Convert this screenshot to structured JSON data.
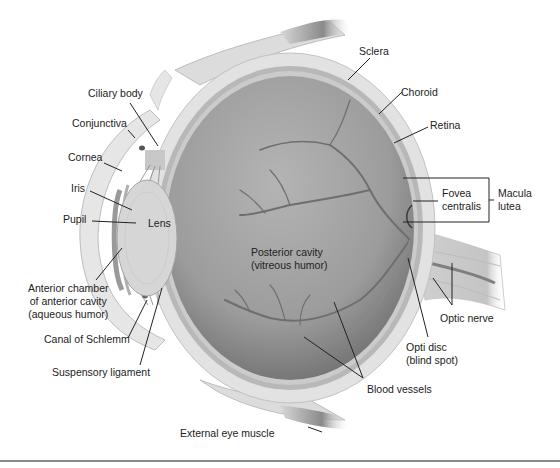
{
  "diagram": {
    "colors": {
      "background": "#ffffff",
      "sclera": "#dcdcdc",
      "choroid": "#b5b5b5",
      "retina": "#c8c8c8",
      "vitreous": "#a8a8a8",
      "vitreous_dark": "#7a7a7a",
      "lens": "#d8d8d8",
      "vessels": "#6e6e6e",
      "leader_lines": "#222222",
      "text": "#222222"
    },
    "labels": {
      "sclera": "Sclera",
      "choroid": "Choroid",
      "retina": "Retina",
      "ciliary_body": "Ciliary body",
      "conjunctiva": "Conjunctiva",
      "cornea": "Cornea",
      "iris": "Iris",
      "pupil": "Pupil",
      "lens": "Lens",
      "fovea_line1": "Fovea",
      "fovea_line2": "centralis",
      "macula_line1": "Macula",
      "macula_line2": "lutea",
      "posterior_line1": "Posterior cavity",
      "posterior_line2": "(vitreous humor)",
      "anterior_line1": "Anterior chamber",
      "anterior_line2": "of anterior cavity",
      "anterior_line3": "(aqueous humor)",
      "optic_nerve": "Optic nerve",
      "optic_disc_line1": "Opti disc",
      "optic_disc_line2": "(blind spot)",
      "canal_of_schlemm": "Canal of Schlemm",
      "suspensory_ligament": "Suspensory ligament",
      "blood_vessels": "Blood vessels",
      "external_eye_muscle": "External eye muscle"
    }
  }
}
